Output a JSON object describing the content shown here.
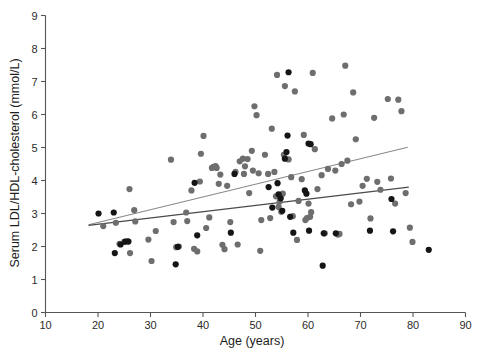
{
  "chart_data": {
    "type": "scatter",
    "title": "",
    "xlabel": "Age (years)",
    "ylabel": "Serum LDL/HDL-cholesterol  (mmol/L)",
    "xlim": [
      10,
      90
    ],
    "ylim": [
      0,
      9
    ],
    "xticks": [
      10,
      20,
      30,
      40,
      50,
      60,
      70,
      80,
      90
    ],
    "yticks": [
      0,
      1,
      2,
      3,
      4,
      5,
      6,
      7,
      8,
      9
    ],
    "xtick_labels": [
      "10",
      "20",
      "30",
      "40",
      "50",
      "60",
      "70",
      "80",
      "90"
    ],
    "ytick_labels": [
      "0",
      "1",
      "2",
      "3",
      "4",
      "5",
      "6",
      "7",
      "8",
      "9"
    ],
    "grid": false,
    "legend": "none",
    "marker_radius": 3.1,
    "series": [
      {
        "name": "group-gray",
        "color": "#6e6e6e",
        "points": [
          [
            21.0,
            2.62
          ],
          [
            23.4,
            2.72
          ],
          [
            24.1,
            2.08
          ],
          [
            25.0,
            2.14
          ],
          [
            25.6,
            2.16
          ],
          [
            26.1,
            1.8
          ],
          [
            26.9,
            3.1
          ],
          [
            27.1,
            2.76
          ],
          [
            26.0,
            3.74
          ],
          [
            29.6,
            2.21
          ],
          [
            30.2,
            1.56
          ],
          [
            31.0,
            2.47
          ],
          [
            33.9,
            4.63
          ],
          [
            34.4,
            2.74
          ],
          [
            34.9,
            1.98
          ],
          [
            35.4,
            2.0
          ],
          [
            36.8,
            3.03
          ],
          [
            37.0,
            2.77
          ],
          [
            37.8,
            3.7
          ],
          [
            38.3,
            1.93
          ],
          [
            38.9,
            1.85
          ],
          [
            39.4,
            3.97
          ],
          [
            39.6,
            4.81
          ],
          [
            40.1,
            5.35
          ],
          [
            40.6,
            2.56
          ],
          [
            41.2,
            2.88
          ],
          [
            41.7,
            4.38
          ],
          [
            42.0,
            4.41
          ],
          [
            42.4,
            4.44
          ],
          [
            42.6,
            4.38
          ],
          [
            43.0,
            3.9
          ],
          [
            43.3,
            4.18
          ],
          [
            43.7,
            2.05
          ],
          [
            44.1,
            1.92
          ],
          [
            44.6,
            3.84
          ],
          [
            45.2,
            2.74
          ],
          [
            46.2,
            4.26
          ],
          [
            46.6,
            2.06
          ],
          [
            47.0,
            4.58
          ],
          [
            47.6,
            4.66
          ],
          [
            47.8,
            4.2
          ],
          [
            48.0,
            4.43
          ],
          [
            48.5,
            4.65
          ],
          [
            48.8,
            3.62
          ],
          [
            49.3,
            4.9
          ],
          [
            49.5,
            4.3
          ],
          [
            49.8,
            6.25
          ],
          [
            50.2,
            5.98
          ],
          [
            50.6,
            4.22
          ],
          [
            50.9,
            1.87
          ],
          [
            51.1,
            2.8
          ],
          [
            51.8,
            4.78
          ],
          [
            52.4,
            4.2
          ],
          [
            52.8,
            2.86
          ],
          [
            53.1,
            5.57
          ],
          [
            53.6,
            4.26
          ],
          [
            53.9,
            3.52
          ],
          [
            54.1,
            7.2
          ],
          [
            54.4,
            3.2
          ],
          [
            54.6,
            3.36
          ],
          [
            54.9,
            3.05
          ],
          [
            55.2,
            3.6
          ],
          [
            55.4,
            4.78
          ],
          [
            55.6,
            6.86
          ],
          [
            56.3,
            4.64
          ],
          [
            56.8,
            4.1
          ],
          [
            57.1,
            2.92
          ],
          [
            57.5,
            6.7
          ],
          [
            57.9,
            2.2
          ],
          [
            58.2,
            3.38
          ],
          [
            58.8,
            4.04
          ],
          [
            59.2,
            5.38
          ],
          [
            59.5,
            2.8
          ],
          [
            59.8,
            2.86
          ],
          [
            60.1,
            3.3
          ],
          [
            60.4,
            2.9
          ],
          [
            60.6,
            3.04
          ],
          [
            60.9,
            7.26
          ],
          [
            61.3,
            4.95
          ],
          [
            61.8,
            3.74
          ],
          [
            62.6,
            4.16
          ],
          [
            63.2,
            2.4
          ],
          [
            63.8,
            4.35
          ],
          [
            64.6,
            5.88
          ],
          [
            65.2,
            4.3
          ],
          [
            65.7,
            2.36
          ],
          [
            66.0,
            2.38
          ],
          [
            66.4,
            4.5
          ],
          [
            66.8,
            6.0
          ],
          [
            67.1,
            7.48
          ],
          [
            67.5,
            4.6
          ],
          [
            68.2,
            3.28
          ],
          [
            68.6,
            6.67
          ],
          [
            69.1,
            5.25
          ],
          [
            69.8,
            3.36
          ],
          [
            70.4,
            3.84
          ],
          [
            71.2,
            4.05
          ],
          [
            71.9,
            2.85
          ],
          [
            72.6,
            5.9
          ],
          [
            73.2,
            3.96
          ],
          [
            73.8,
            3.72
          ],
          [
            75.2,
            6.47
          ],
          [
            75.8,
            4.06
          ],
          [
            76.6,
            3.3
          ],
          [
            77.2,
            6.45
          ],
          [
            77.8,
            6.1
          ],
          [
            78.6,
            3.62
          ],
          [
            79.4,
            2.57
          ],
          [
            79.9,
            2.14
          ]
        ]
      },
      {
        "name": "group-black",
        "color": "#151515",
        "points": [
          [
            20.1,
            3.0
          ],
          [
            23.0,
            3.03
          ],
          [
            23.2,
            1.8
          ],
          [
            24.3,
            2.06
          ],
          [
            25.2,
            2.15
          ],
          [
            25.8,
            2.15
          ],
          [
            34.8,
            1.46
          ],
          [
            35.2,
            1.99
          ],
          [
            38.4,
            3.93
          ],
          [
            38.9,
            2.34
          ],
          [
            45.3,
            2.42
          ],
          [
            46.0,
            4.2
          ],
          [
            52.5,
            3.8
          ],
          [
            53.2,
            3.18
          ],
          [
            54.2,
            3.92
          ],
          [
            54.4,
            3.58
          ],
          [
            54.8,
            3.46
          ],
          [
            55.1,
            3.08
          ],
          [
            55.6,
            4.66
          ],
          [
            55.9,
            4.86
          ],
          [
            56.1,
            5.36
          ],
          [
            56.3,
            7.28
          ],
          [
            56.6,
            2.9
          ],
          [
            57.2,
            2.42
          ],
          [
            59.4,
            3.7
          ],
          [
            59.7,
            3.6
          ],
          [
            60.1,
            5.12
          ],
          [
            60.5,
            5.1
          ],
          [
            60.2,
            2.48
          ],
          [
            62.8,
            1.42
          ],
          [
            63.0,
            2.4
          ],
          [
            65.3,
            2.4
          ],
          [
            71.8,
            2.48
          ],
          [
            75.9,
            3.44
          ],
          [
            76.2,
            2.46
          ],
          [
            83.0,
            1.9
          ]
        ]
      }
    ],
    "trend_lines": [
      {
        "name": "upper-trend-line",
        "color": "#8a8a8a",
        "x_start": 18.2,
        "y_start": 2.66,
        "x_end": 79.0,
        "y_end": 5.01
      },
      {
        "name": "lower-trend-line",
        "color": "#4a4a4a",
        "x_start": 18.2,
        "y_start": 2.64,
        "x_end": 79.2,
        "y_end": 3.8
      }
    ]
  }
}
